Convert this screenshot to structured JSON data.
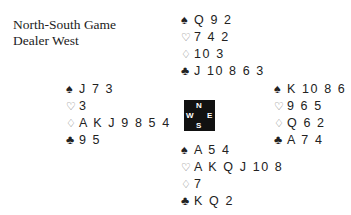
{
  "header": {
    "vulnerability": "North-South Game",
    "dealer": "Dealer West"
  },
  "hands": {
    "north": {
      "spades": {
        "symbol": "♠",
        "cards": "Q 9 2"
      },
      "hearts": {
        "symbol": "♡",
        "cards": "7 4 2"
      },
      "diamonds": {
        "symbol": "♢",
        "cards": "10 3"
      },
      "clubs": {
        "symbol": "♣",
        "cards": "J 10 8 6 3"
      }
    },
    "west": {
      "spades": {
        "symbol": "♠",
        "cards": "J 7 3"
      },
      "hearts": {
        "symbol": "♡",
        "cards": "3"
      },
      "diamonds": {
        "symbol": "♢",
        "cards": "A K J 9 8 5 4"
      },
      "clubs": {
        "symbol": "♣",
        "cards": "9 5"
      }
    },
    "east": {
      "spades": {
        "symbol": "♠",
        "cards": "K 10 8 6"
      },
      "hearts": {
        "symbol": "♡",
        "cards": "9 6 5"
      },
      "diamonds": {
        "symbol": "♢",
        "cards": "Q 6 2"
      },
      "clubs": {
        "symbol": "♣",
        "cards": "A 7 4"
      }
    },
    "south": {
      "spades": {
        "symbol": "♠",
        "cards": "A 5 4"
      },
      "hearts": {
        "symbol": "♡",
        "cards": "A K Q J 10 8"
      },
      "diamonds": {
        "symbol": "♢",
        "cards": "7"
      },
      "clubs": {
        "symbol": "♣",
        "cards": "K Q 2"
      }
    }
  },
  "compass": {
    "n": "N",
    "s": "S",
    "e": "E",
    "w": "W"
  }
}
